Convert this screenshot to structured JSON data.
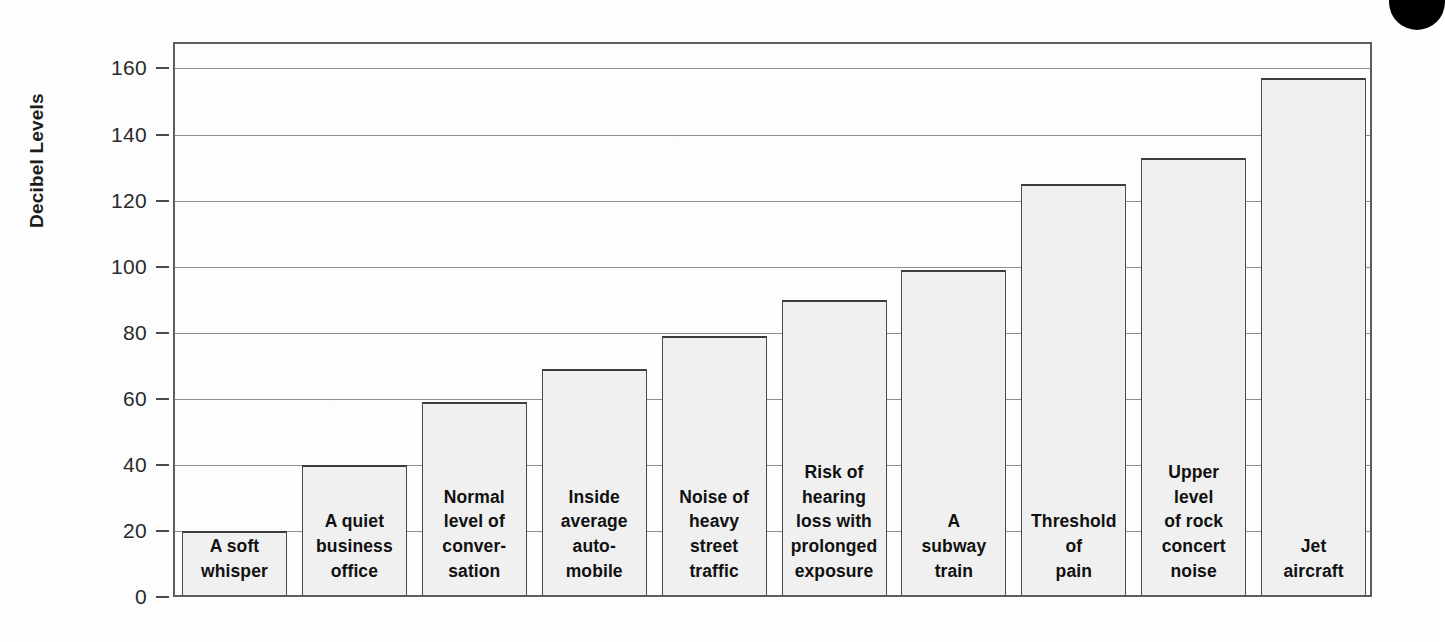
{
  "chart_data": {
    "type": "bar",
    "title": "",
    "xlabel": "",
    "ylabel": "Decibel Levels",
    "ylim": [
      0,
      168
    ],
    "yticks": [
      0,
      20,
      40,
      60,
      80,
      100,
      120,
      140,
      160
    ],
    "ytick_labels": [
      "0",
      "20",
      "40",
      "60",
      "80",
      "100",
      "120",
      "140",
      "160"
    ],
    "grid": true,
    "legend": "none",
    "categories": [
      "A soft whisper",
      "A quiet business office",
      "Normal level of conver-sation",
      "Inside average auto-mobile",
      "Noise of heavy street traffic",
      "Risk of hearing loss with prolonged exposure",
      "A subway train",
      "Threshold of pain",
      "Upper level of rock concert noise",
      "Jet aircraft"
    ],
    "values": [
      20,
      40,
      59,
      69,
      79,
      90,
      99,
      125,
      133,
      157
    ],
    "bars": [
      {
        "label_lines": [
          "A soft",
          "whisper"
        ],
        "value": 20
      },
      {
        "label_lines": [
          "A quiet",
          "business",
          "office"
        ],
        "value": 40
      },
      {
        "label_lines": [
          "Normal",
          "level of",
          "conver-",
          "sation"
        ],
        "value": 59
      },
      {
        "label_lines": [
          "Inside",
          "average",
          "auto-",
          "mobile"
        ],
        "value": 69
      },
      {
        "label_lines": [
          "Noise of",
          "heavy",
          "street",
          "traffic"
        ],
        "value": 79
      },
      {
        "label_lines": [
          "Risk of",
          "hearing",
          "loss with",
          "prolonged",
          "exposure"
        ],
        "value": 90
      },
      {
        "label_lines": [
          "A",
          "subway",
          "train"
        ],
        "value": 99
      },
      {
        "label_lines": [
          "Threshold",
          "of",
          "pain"
        ],
        "value": 125
      },
      {
        "label_lines": [
          "Upper",
          "level",
          "of rock",
          "concert",
          "noise"
        ],
        "value": 133
      },
      {
        "label_lines": [
          "Jet",
          "aircraft"
        ],
        "value": 157
      }
    ],
    "colors": {
      "bar_fill": "#f0f0f0",
      "bar_stroke": "#4a4a4a",
      "gridline": "#8e8e8e",
      "frame": "#5d5d5d",
      "text": "#111111",
      "background": "#fdfdfd",
      "corner_mark": "#000000"
    }
  }
}
